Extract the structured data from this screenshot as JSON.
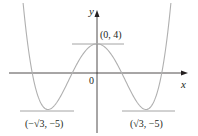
{
  "chart_data": {
    "type": "line",
    "title": "",
    "function": "y = x^4 - 6x^2 + 4",
    "xlabel": "x",
    "ylabel": "y",
    "origin_label": "0",
    "grid": false,
    "legend": null,
    "series": [
      {
        "name": "f(x)",
        "x": [
          -2.6,
          -2.4,
          -2.2,
          -2.0,
          -1.732,
          -1.4,
          -1.0,
          -0.6,
          0,
          0.6,
          1.0,
          1.4,
          1.732,
          2.0,
          2.2,
          2.4,
          2.6
        ],
        "y": [
          9.12,
          2.62,
          -1.62,
          -4.0,
          -5.0,
          -3.92,
          -1.0,
          2.0,
          4,
          2.0,
          -1.0,
          -3.92,
          -5.0,
          -4.0,
          -1.62,
          2.62,
          9.12
        ]
      }
    ],
    "annotations": [
      {
        "label": "(0, 4)",
        "x": 0,
        "y": 4,
        "type": "local maximum",
        "tangent": "horizontal"
      },
      {
        "label": "(−√3, −5)",
        "x": -1.732,
        "y": -5,
        "type": "local minimum",
        "tangent": "horizontal"
      },
      {
        "label": "(√3, −5)",
        "x": 1.732,
        "y": -5,
        "type": "local minimum",
        "tangent": "horizontal"
      }
    ]
  },
  "colors": {
    "axis": "#231f20",
    "curve": "#b0b0b0",
    "tangent": "#9a9a9a",
    "text": "#231f20"
  }
}
